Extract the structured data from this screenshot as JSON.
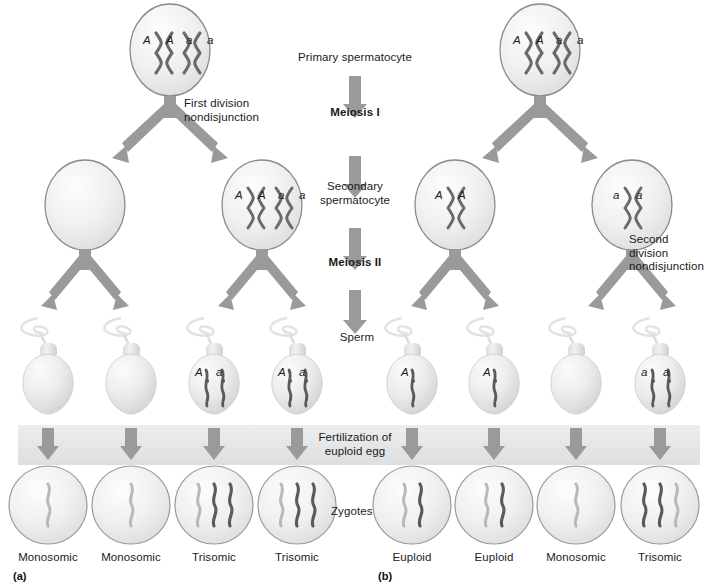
{
  "figure": {
    "panel_a_tag": "(a)",
    "panel_b_tag": "(b)"
  },
  "center_column": {
    "primary_spermatocyte": "Primary spermatocyte",
    "meiosis_i": "Meiosis I",
    "secondary_spermatocyte": "Secondary\nspermatocyte",
    "meiosis_ii": "Meiosis II",
    "sperm": "Sperm",
    "fertilization": "Fertilization of\neuploid egg",
    "zygotes": "Zygotes"
  },
  "annotations": {
    "first_division": "First division\nnondisjunction",
    "second_division": "Second\ndivision\nnondisjunction"
  },
  "colors": {
    "arrow": "#9a9a9a",
    "cell_outline": "#8b8b8b",
    "chromosome_dark": "#5a5a5a",
    "chromosome_light": "#b9b9b9",
    "band": "#e6e7e8",
    "text": "#1a1a1a"
  },
  "panel_a": {
    "primary_spermatocyte": {
      "alleles": [
        "A",
        "A",
        "a",
        "a"
      ],
      "chromosome_pairs": 2
    },
    "secondary_spermatocytes": [
      {
        "alleles": [],
        "chromosome_pairs": 0
      },
      {
        "alleles": [
          "A",
          "A",
          "a",
          "a"
        ],
        "chromosome_pairs": 2
      }
    ],
    "sperm": [
      {
        "alleles": [],
        "chromatids": 0
      },
      {
        "alleles": [],
        "chromatids": 0
      },
      {
        "alleles": [
          "A",
          "a"
        ],
        "chromatids": 2
      },
      {
        "alleles": [
          "A",
          "a"
        ],
        "chromatids": 2
      }
    ],
    "zygotes": [
      {
        "label": "Monosomic",
        "paternal": 0,
        "maternal": 1
      },
      {
        "label": "Monosomic",
        "paternal": 0,
        "maternal": 1
      },
      {
        "label": "Trisomic",
        "paternal": 2,
        "maternal": 1
      },
      {
        "label": "Trisomic",
        "paternal": 2,
        "maternal": 1
      }
    ]
  },
  "panel_b": {
    "primary_spermatocyte": {
      "alleles": [
        "A",
        "A",
        "a",
        "a"
      ],
      "chromosome_pairs": 2
    },
    "secondary_spermatocytes": [
      {
        "alleles": [
          "A",
          "A"
        ],
        "chromosome_pairs": 1
      },
      {
        "alleles": [
          "a",
          "a"
        ],
        "chromosome_pairs": 1
      }
    ],
    "sperm": [
      {
        "alleles": [
          "A"
        ],
        "chromatids": 1
      },
      {
        "alleles": [
          "A"
        ],
        "chromatids": 1
      },
      {
        "alleles": [],
        "chromatids": 0
      },
      {
        "alleles": [
          "a",
          "a"
        ],
        "chromatids": 2
      }
    ],
    "zygotes": [
      {
        "label": "Euploid",
        "paternal": 1,
        "maternal": 1
      },
      {
        "label": "Euploid",
        "paternal": 1,
        "maternal": 1
      },
      {
        "label": "Monosomic",
        "paternal": 0,
        "maternal": 1
      },
      {
        "label": "Trisomic",
        "paternal": 2,
        "maternal": 1
      }
    ]
  }
}
